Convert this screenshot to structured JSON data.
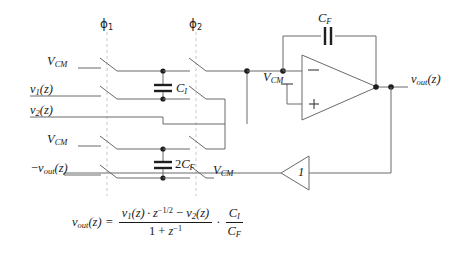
{
  "diagram": {
    "colors": {
      "wire": "#5a5a5a",
      "wire_dark": "#2b2b2b",
      "clock_dash": "#c8c8c8",
      "text": "#1a1a1a",
      "background": "#ffffff"
    },
    "clocks": [
      {
        "name": "phi1",
        "label": "ϕ",
        "index": "1"
      },
      {
        "name": "phi2",
        "label": "ϕ",
        "index": "2"
      }
    ],
    "input_labels": [
      {
        "name": "vcm-top",
        "text": "V",
        "sub": "CM",
        "prefix": ""
      },
      {
        "name": "v1-input",
        "text": "v",
        "sub": "1",
        "suffix": "(z)"
      },
      {
        "name": "v2-input",
        "text": "v",
        "sub": "2",
        "suffix": "(z)"
      },
      {
        "name": "vcm-mid",
        "text": "V",
        "sub": "CM",
        "prefix": ""
      },
      {
        "name": "minus-vout",
        "text": "v",
        "sub": "out",
        "suffix": "(z)",
        "prefix": "−"
      }
    ],
    "capacitors": [
      {
        "name": "cap-ci",
        "text": "C",
        "sub": "I",
        "prefix": ""
      },
      {
        "name": "cap-2cf",
        "text": "C",
        "sub": "F",
        "prefix": "2"
      },
      {
        "name": "cap-cf",
        "text": "C",
        "sub": "F",
        "prefix": ""
      }
    ],
    "opamp": {
      "minus_terminal": "−",
      "plus_terminal": "+",
      "bias_label": "V",
      "bias_sub": "CM"
    },
    "inverter": {
      "gain_label": "1"
    },
    "right_switch_label": {
      "text": "V",
      "sub": "CM"
    },
    "output_label": {
      "text": "v",
      "sub": "out",
      "suffix": "(z)"
    }
  },
  "formula": {
    "lhs": "v",
    "lhs_sub": "out",
    "lhs_arg": "(z)",
    "equals": "=",
    "num_v1": "v",
    "num_v1_sub": "1",
    "num_v1_arg": "(z)",
    "dot": "·",
    "num_z": "z",
    "num_z_exp": "−1/2",
    "num_minus": "−",
    "num_v2": "v",
    "num_v2_sub": "2",
    "num_v2_arg": "(z)",
    "den_one": "1 +",
    "den_z": "z",
    "den_z_exp": "−1",
    "mult": "·",
    "ratio_num": "C",
    "ratio_num_sub": "I",
    "ratio_den": "C",
    "ratio_den_sub": "F"
  }
}
